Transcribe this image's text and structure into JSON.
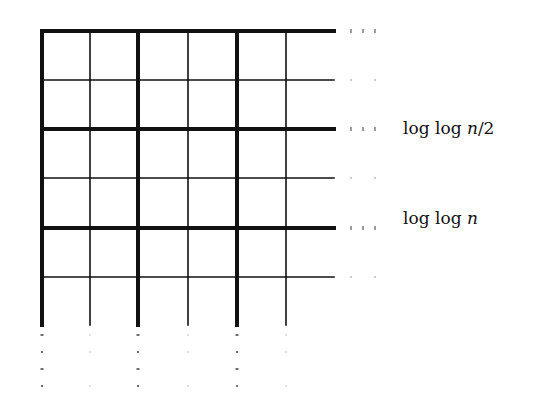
{
  "figure": {
    "type": "grid-diagram",
    "grid": {
      "x_lines": [
        42,
        90,
        138,
        188,
        237,
        286
      ],
      "y_lines": [
        31,
        80,
        129,
        178,
        228,
        277
      ],
      "thick_x": [
        0,
        2,
        4
      ],
      "thick_y": [
        0,
        2,
        4
      ],
      "x_end": 334,
      "y_end": 325,
      "thin_width": 1.6,
      "thick_width": 4,
      "color": "#111111"
    },
    "labels": [
      {
        "id": "label-loglog-n-half",
        "prefix": "log log ",
        "var": "n",
        "suffix": "/2",
        "y": 129
      },
      {
        "id": "label-loglog-n",
        "prefix": "log log ",
        "var": "n",
        "suffix": "",
        "y": 228
      }
    ]
  }
}
